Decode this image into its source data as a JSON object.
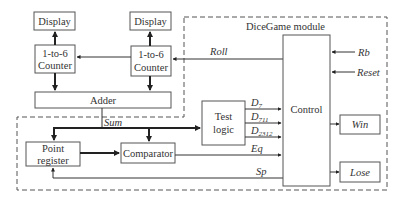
{
  "diagram": {
    "module_title": "DiceGame module",
    "blocks": {
      "display_left": "Display",
      "display_right": "Display",
      "counter_left_line1": "1-to-6",
      "counter_left_line2": "Counter",
      "counter_right_line1": "1-to-6",
      "counter_right_line2": "Counter",
      "adder": "Adder",
      "test_logic_line1": "Test",
      "test_logic_line2": "logic",
      "control": "Control",
      "win": "Win",
      "lose": "Lose",
      "point_register_line1": "Point",
      "point_register_line2": "register",
      "comparator": "Comparator"
    },
    "signals": {
      "roll": "Roll",
      "rb": "Rb",
      "reset": "Reset",
      "sum": "Sum",
      "d7_base": "D",
      "d7_sub": "7",
      "d711_base": "D",
      "d711_sub": "711",
      "d2312_base": "D",
      "d2312_sub": "2312",
      "eq": "Eq",
      "sp": "Sp"
    }
  }
}
